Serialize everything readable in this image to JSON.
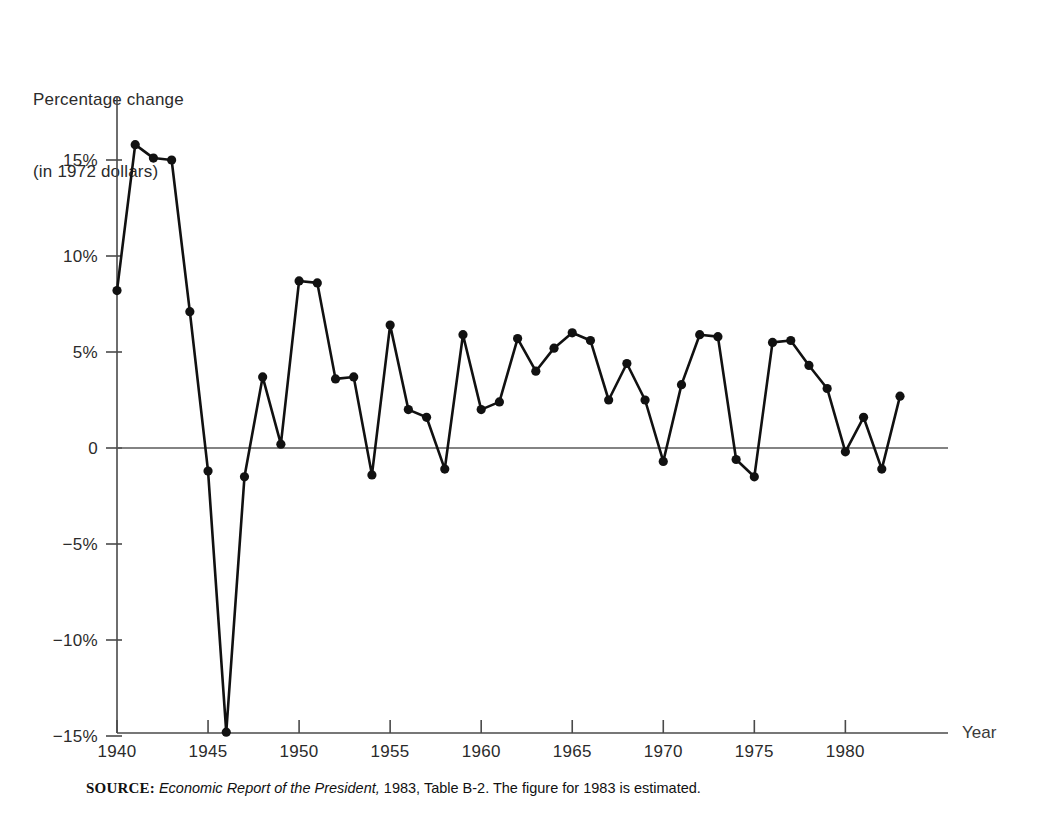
{
  "figure": {
    "y_axis_title_line1": "Percentage change",
    "y_axis_title_line2": "(in 1972 dollars)",
    "x_axis_name": "Year",
    "source_label": "SOURCE:",
    "source_title": "Economic Report of the President,",
    "source_rest": " 1983, Table B-2. The figure for 1983 is estimated."
  },
  "chart_data": {
    "type": "line",
    "title": "",
    "subtitle": "",
    "xlabel": "Year",
    "ylabel": "Percentage change (in 1972 dollars)",
    "x": [
      1940,
      1941,
      1942,
      1943,
      1944,
      1945,
      1946,
      1947,
      1948,
      1949,
      1950,
      1951,
      1952,
      1953,
      1954,
      1955,
      1956,
      1957,
      1958,
      1959,
      1960,
      1961,
      1962,
      1963,
      1964,
      1965,
      1966,
      1967,
      1968,
      1969,
      1970,
      1971,
      1972,
      1973,
      1974,
      1975,
      1976,
      1977,
      1978,
      1979,
      1980,
      1981,
      1982,
      1983
    ],
    "values": [
      8.2,
      15.8,
      15.1,
      15.0,
      7.1,
      -1.2,
      -14.8,
      -1.5,
      3.7,
      0.2,
      8.7,
      8.6,
      3.6,
      3.7,
      -1.4,
      6.4,
      2.0,
      1.6,
      -1.1,
      5.9,
      2.0,
      2.4,
      5.7,
      4.0,
      5.2,
      6.0,
      5.6,
      2.5,
      4.4,
      2.5,
      -0.7,
      3.3,
      5.9,
      5.8,
      -0.6,
      -1.5,
      5.5,
      5.6,
      4.3,
      3.1,
      -0.2,
      1.6,
      -1.1,
      2.7
    ],
    "series": [
      {
        "name": "Percentage change in real GNP",
        "values": [
          8.2,
          15.8,
          15.1,
          15.0,
          7.1,
          -1.2,
          -14.8,
          -1.5,
          3.7,
          0.2,
          8.7,
          8.6,
          3.6,
          3.7,
          -1.4,
          6.4,
          2.0,
          1.6,
          -1.1,
          5.9,
          2.0,
          2.4,
          5.7,
          4.0,
          5.2,
          6.0,
          5.6,
          2.5,
          4.4,
          2.5,
          -0.7,
          3.3,
          5.9,
          5.8,
          -0.6,
          -1.5,
          5.5,
          5.6,
          4.3,
          3.1,
          -0.2,
          1.6,
          -1.1,
          2.7
        ]
      }
    ],
    "ylim": [
      -15,
      17
    ],
    "xlim": [
      1940,
      1983
    ],
    "ytick_values": [
      15,
      10,
      5,
      0,
      -5,
      -10,
      -15
    ],
    "ytick_labels": [
      "15%",
      "10%",
      "5%",
      "0",
      "−5%",
      "−10%",
      "−15%"
    ],
    "xtick_values": [
      1940,
      1945,
      1950,
      1955,
      1960,
      1965,
      1970,
      1975,
      1980
    ],
    "xtick_labels": [
      "1940",
      "1945",
      "1950",
      "1955",
      "1960",
      "1965",
      "1970",
      "1975",
      "1980"
    ],
    "grid": false,
    "legend": "none",
    "zero_line": true,
    "marker": "filled-circle",
    "line_color": "#111111",
    "axis_color": "#4a4a4a"
  }
}
